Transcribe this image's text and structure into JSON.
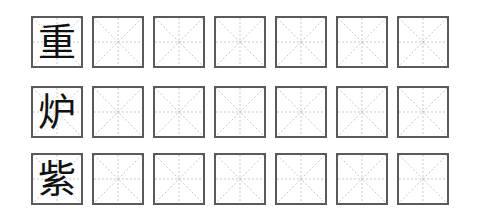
{
  "worksheet": {
    "rows": [
      {
        "character": "重",
        "practice_cells": 6
      },
      {
        "character": "炉",
        "practice_cells": 6
      },
      {
        "character": "紫",
        "practice_cells": 6
      }
    ],
    "colors": {
      "border": "#5a5a5a",
      "guide": "#bbbbbb",
      "text": "#111111"
    }
  }
}
